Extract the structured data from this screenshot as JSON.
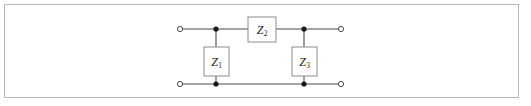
{
  "figure": {
    "kind": "two-port-t-network-circuit-diagram",
    "border_color": "#b9b9b9",
    "background_color": "#ffffff",
    "wire_color": "#4a4a4a",
    "box_stroke_color": "#8c8c8c",
    "node_fill_color": "#1a1a1a",
    "terminal_stroke_color": "#4a4a4a",
    "terminal_fill_color": "#ffffff"
  },
  "components": {
    "series": {
      "symbol": "Z",
      "subscript": "2",
      "orientation": "horizontal",
      "box": {
        "x": 248,
        "y": 17,
        "w": 28,
        "h": 25
      }
    },
    "shunt_left": {
      "symbol": "Z",
      "subscript": "1",
      "orientation": "vertical",
      "box": {
        "x": 204,
        "y": 47,
        "w": 25,
        "h": 29
      }
    },
    "shunt_right": {
      "symbol": "Z",
      "subscript": "3",
      "orientation": "vertical",
      "box": {
        "x": 292,
        "y": 47,
        "w": 25,
        "h": 29
      }
    }
  },
  "rails": {
    "top_y": 29,
    "bottom_y": 84,
    "left_terminal_x": 180,
    "right_terminal_x": 341,
    "left_node_x": 216,
    "right_node_x": 304
  },
  "terminals": [
    {
      "name": "input-top",
      "x": 180,
      "y": 29,
      "type": "open-circle"
    },
    {
      "name": "input-bottom",
      "x": 180,
      "y": 84,
      "type": "open-circle"
    },
    {
      "name": "output-top",
      "x": 341,
      "y": 29,
      "type": "open-circle"
    },
    {
      "name": "output-bottom",
      "x": 341,
      "y": 84,
      "type": "open-circle"
    }
  ],
  "nodes": [
    {
      "name": "node-top-left",
      "x": 216,
      "y": 29,
      "type": "filled-dot"
    },
    {
      "name": "node-top-right",
      "x": 304,
      "y": 29,
      "type": "filled-dot"
    },
    {
      "name": "node-bottom-left",
      "x": 216,
      "y": 84,
      "type": "filled-dot"
    },
    {
      "name": "node-bottom-right",
      "x": 304,
      "y": 84,
      "type": "filled-dot"
    }
  ]
}
